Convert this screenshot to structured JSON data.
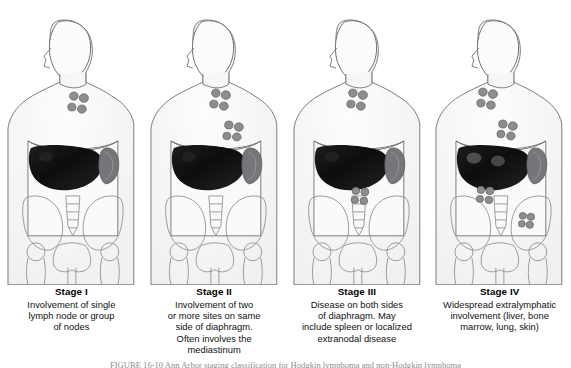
{
  "figure": {
    "background_color": "#ffffff",
    "panel_count": 4,
    "bottom_note": "FIGURE 16-10    Ann Arbor staging classification for Hodgkin lymphoma and non-Hodgkin lymphoma"
  },
  "colors": {
    "body_outline": "#6e7072",
    "body_fill": "#fbfbfb",
    "skin_shade": "#f2f2f2",
    "liver": "#121212",
    "liver_mid": "#1e1e1e",
    "spleen": "#6f7173",
    "lymph_node": "#8a8c8e",
    "lymph_node_outline": "#5d5f61",
    "bone_outline": "#8a8d90",
    "lesion": "#5a5c5e",
    "caption_text": "#111111"
  },
  "panels": [
    {
      "id": "stage-1",
      "stage": "Stage I",
      "description": "Involvement of single\nlymph node or group\nof nodes",
      "node_clusters": [
        {
          "name": "cervical-supraclavicular-nodes",
          "cx": 78,
          "cy": 101,
          "region": "neck"
        }
      ],
      "organs": [
        "liver",
        "spleen"
      ],
      "liver_lesions": 0
    },
    {
      "id": "stage-2",
      "stage": "Stage II",
      "description": "Involvement of two\nor more sites on same\nside of diaphragm.\nOften involves the\nmediastinum",
      "node_clusters": [
        {
          "name": "cervical-supraclavicular-nodes",
          "cx": 78,
          "cy": 99,
          "region": "neck"
        },
        {
          "name": "mediastinal-nodes",
          "cx": 91,
          "cy": 132,
          "region": "mediastinum"
        }
      ],
      "organs": [
        "liver",
        "spleen"
      ],
      "liver_lesions": 0
    },
    {
      "id": "stage-3",
      "stage": "Stage III",
      "description": "Disease on both sides\nof diaphragm.  May\ninclude spleen or localized\nextranodal disease",
      "node_clusters": [
        {
          "name": "cervical-supraclavicular-nodes",
          "cx": 72,
          "cy": 99,
          "region": "neck"
        },
        {
          "name": "para-aortic-nodes",
          "cx": 75,
          "cy": 196,
          "region": "abdomen"
        }
      ],
      "organs": [
        "liver",
        "spleen"
      ],
      "liver_lesions": 0
    },
    {
      "id": "stage-4",
      "stage": "Stage IV",
      "description": "Widespread extralymphatic\ninvolvement (liver, bone\nmarrow, lung, skin)",
      "node_clusters": [
        {
          "name": "cervical-supraclavicular-nodes",
          "cx": 60,
          "cy": 98,
          "region": "neck"
        },
        {
          "name": "mediastinal-nodes",
          "cx": 80,
          "cy": 131,
          "region": "mediastinum"
        },
        {
          "name": "para-aortic-nodes",
          "cx": 58,
          "cy": 195,
          "region": "abdomen"
        },
        {
          "name": "iliac-nodes",
          "cx": 100,
          "cy": 220,
          "region": "pelvis"
        }
      ],
      "organs": [
        "liver",
        "spleen"
      ],
      "liver_lesions": 2
    }
  ]
}
